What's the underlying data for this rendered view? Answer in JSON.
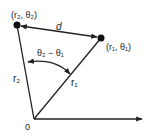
{
  "diagram": {
    "colors": {
      "stroke": "#222222",
      "background": "#ffffff"
    },
    "points": [
      {
        "id": "p2",
        "label": "(r₂, θ₂)",
        "x": 17,
        "y": 25
      },
      {
        "id": "p1",
        "label": "(r₁, θ₁)",
        "x": 101,
        "y": 38
      }
    ],
    "origin": {
      "label": "0",
      "x": 34,
      "y": 119
    },
    "labels": {
      "distance": "d",
      "angle": "θ₂ − θ₁",
      "r1": "r₁",
      "r2": "r₂",
      "origin": "0",
      "p1": "(r₁, θ₁)",
      "p2": "(r₂, θ₂)"
    }
  }
}
